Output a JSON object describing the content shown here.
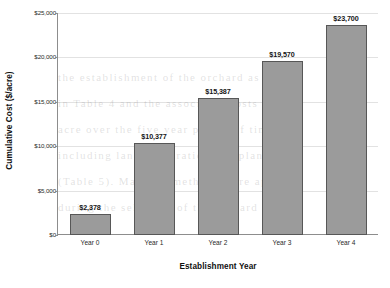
{
  "chart_data": {
    "type": "bar",
    "title": "",
    "subtitle": "",
    "categories": [
      "Year 0",
      "Year 1",
      "Year 2",
      "Year 3",
      "Year 4"
    ],
    "values": [
      2378,
      10377,
      15387,
      19570,
      23700
    ],
    "value_labels": [
      "$2,378",
      "$10,377",
      "$15,387",
      "$19,570",
      "$23,700"
    ],
    "xlabel": "Establishment Year",
    "ylabel": "Cumulative Cost ($/acre)",
    "ylim": [
      0,
      25000
    ],
    "ytick_values": [
      0,
      5000,
      10000,
      15000,
      20000,
      25000
    ],
    "ytick_labels": [
      "$0",
      "$5,000",
      "$10,000",
      "$15,000",
      "$20,000",
      "$25,000"
    ],
    "grid": "horizontal",
    "legend": "none",
    "bar_color": "#9b9b9b",
    "bar_border_color": "#575757",
    "gridline_color": "#e2e2e2",
    "axis_color": "#8d8d8d",
    "text_color": "#101010"
  },
  "watermark": {
    "lines": [
      "the establishment of the orchard as shown",
      "in Table 4 and the associated costs per",
      "acre over the five year period of time",
      "including land preparation and planting",
      "(Table 5). Mapping methods were applied",
      "during the selection of the orchard site"
    ]
  }
}
